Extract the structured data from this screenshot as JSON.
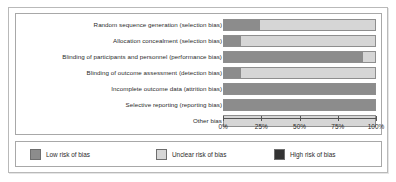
{
  "chart_data": {
    "type": "bar",
    "title": "",
    "xlabel": "",
    "ylabel": "",
    "orientation": "horizontal",
    "stacked": true,
    "normalized_percent": true,
    "xlim": [
      0,
      100
    ],
    "grid": false,
    "legend_position": "bottom",
    "categories": [
      "Random sequence generation (selection bias)",
      "Allocation concealment (selection bias)",
      "Blinding of participants and personnel (performance bias)",
      "Blinding of outcome assessment (detection bias)",
      "Incomplete outcome data (attrition bias)",
      "Selective reporting (reporting bias)",
      "Other bias"
    ],
    "series": [
      {
        "name": "Low risk of bias",
        "color": "#8c8c8c",
        "values": [
          24,
          11,
          92,
          11,
          100,
          100,
          0
        ]
      },
      {
        "name": "Unclear risk of bias",
        "color": "#d6d6d6",
        "values": [
          76,
          89,
          8,
          89,
          0,
          0,
          100
        ]
      },
      {
        "name": "High risk of bias",
        "color": "#333333",
        "values": [
          0,
          0,
          0,
          0,
          0,
          0,
          0
        ]
      }
    ],
    "ticks": [
      {
        "value": 0,
        "label": "0%"
      },
      {
        "value": 25,
        "label": "25%"
      },
      {
        "value": 50,
        "label": "50%"
      },
      {
        "value": 75,
        "label": "75%"
      },
      {
        "value": 100,
        "label": "100%"
      }
    ]
  },
  "legend": {
    "items": [
      {
        "label": "Low risk of bias",
        "color": "#8c8c8c"
      },
      {
        "label": "Unclear risk of bias",
        "color": "#d6d6d6"
      },
      {
        "label": "High risk of bias",
        "color": "#333333"
      }
    ]
  }
}
